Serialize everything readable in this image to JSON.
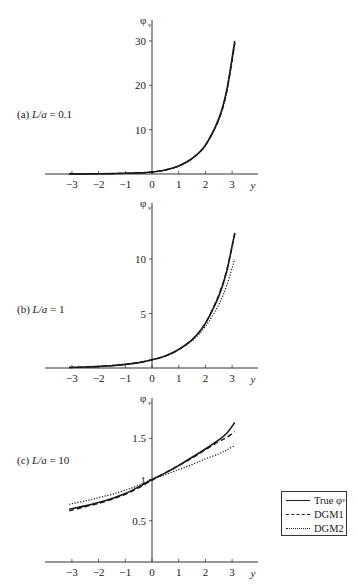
{
  "figure": {
    "legend": [
      {
        "label": "True φ",
        "sub": "v",
        "style": "solid"
      },
      {
        "label": "DGM1",
        "style": "dashed"
      },
      {
        "label": "DGM2",
        "style": "dotted"
      }
    ]
  },
  "chart_data": [
    {
      "type": "line",
      "panel": "a",
      "title": "(a) L/a = 0.1",
      "label_prefix": "(a) ",
      "label_var": "L/a",
      "label_value": " = 0.1",
      "xlabel": "y",
      "ylabel": "φv",
      "xlim": [
        -3.1,
        3.1
      ],
      "ylim": [
        0,
        30
      ],
      "xticks": [
        -3,
        -2,
        -1,
        0,
        1,
        2,
        3
      ],
      "yticks": [
        10,
        20,
        30
      ],
      "x": [
        -3.1,
        -2.5,
        -2,
        -1.5,
        -1,
        -0.5,
        0,
        0.5,
        1,
        1.5,
        2,
        2.5,
        2.8,
        3.1
      ],
      "series": [
        {
          "name": "True φv",
          "style": "solid",
          "values": [
            0.02,
            0.03,
            0.05,
            0.09,
            0.15,
            0.25,
            0.45,
            0.9,
            1.8,
            3.5,
            6.5,
            12.5,
            19.0,
            30.0
          ]
        },
        {
          "name": "DGM1",
          "style": "dashed",
          "values": [
            0.02,
            0.03,
            0.05,
            0.09,
            0.15,
            0.25,
            0.45,
            0.9,
            1.8,
            3.5,
            6.5,
            12.3,
            18.7,
            29.5
          ]
        },
        {
          "name": "DGM2",
          "style": "dotted",
          "values": [
            0.02,
            0.03,
            0.05,
            0.09,
            0.15,
            0.25,
            0.45,
            0.9,
            1.8,
            3.5,
            6.4,
            12.2,
            18.5,
            29.3
          ]
        }
      ]
    },
    {
      "type": "line",
      "panel": "b",
      "title": "(b) L/a = 1",
      "label_prefix": "(b) ",
      "label_var": "L/a",
      "label_value": " = 1",
      "xlabel": "y",
      "ylabel": "φv",
      "xlim": [
        -3.1,
        3.1
      ],
      "ylim": [
        0,
        12.5
      ],
      "xticks": [
        -3,
        -2,
        -1,
        0,
        1,
        2,
        3
      ],
      "yticks": [
        5,
        10
      ],
      "x": [
        -3.1,
        -2.5,
        -2,
        -1.5,
        -1,
        -0.5,
        0,
        0.5,
        1,
        1.5,
        2,
        2.5,
        2.8,
        3.1
      ],
      "series": [
        {
          "name": "True φv",
          "style": "solid",
          "values": [
            0.05,
            0.09,
            0.14,
            0.22,
            0.33,
            0.5,
            0.75,
            1.1,
            1.7,
            2.6,
            4.1,
            6.6,
            8.9,
            12.4
          ]
        },
        {
          "name": "DGM1",
          "style": "dashed",
          "values": [
            0.05,
            0.09,
            0.14,
            0.22,
            0.33,
            0.5,
            0.75,
            1.1,
            1.7,
            2.6,
            4.1,
            6.7,
            9.0,
            12.3
          ]
        },
        {
          "name": "DGM2",
          "style": "dotted",
          "values": [
            0.05,
            0.09,
            0.14,
            0.22,
            0.33,
            0.5,
            0.75,
            1.1,
            1.7,
            2.5,
            3.8,
            5.8,
            7.6,
            10.0
          ]
        }
      ]
    },
    {
      "type": "line",
      "panel": "c",
      "title": "(c) L/a = 10",
      "label_prefix": "(c) ",
      "label_var": "L/a",
      "label_value": " = 10",
      "xlabel": "y",
      "ylabel": "φv",
      "xlim": [
        -3.1,
        3.1
      ],
      "ylim": [
        0,
        1.75
      ],
      "xticks": [
        -3,
        -2,
        -1,
        0,
        1,
        2,
        3
      ],
      "yticks": [
        0.5,
        1,
        1.5
      ],
      "x": [
        -3.1,
        -2.5,
        -2,
        -1.5,
        -1,
        -0.5,
        0,
        0.5,
        1,
        1.5,
        2,
        2.5,
        2.8,
        3.1
      ],
      "series": [
        {
          "name": "True φv",
          "style": "solid",
          "values": [
            0.64,
            0.68,
            0.72,
            0.77,
            0.83,
            0.91,
            1.0,
            1.08,
            1.17,
            1.27,
            1.37,
            1.48,
            1.56,
            1.69
          ]
        },
        {
          "name": "DGM1",
          "style": "dashed",
          "values": [
            0.62,
            0.67,
            0.71,
            0.76,
            0.82,
            0.9,
            0.99,
            1.08,
            1.17,
            1.26,
            1.36,
            1.46,
            1.51,
            1.58
          ]
        },
        {
          "name": "DGM2",
          "style": "dotted",
          "values": [
            0.7,
            0.74,
            0.78,
            0.82,
            0.87,
            0.93,
            1.0,
            1.06,
            1.12,
            1.18,
            1.25,
            1.31,
            1.36,
            1.41
          ]
        }
      ]
    }
  ]
}
